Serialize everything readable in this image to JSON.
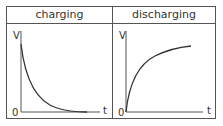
{
  "panels": [
    {
      "title": "charging",
      "y_axis_label": "V",
      "x_axis_label": "t",
      "origin_label": "0",
      "curve": "exponential-decay"
    },
    {
      "title": "discharging",
      "y_axis_label": "V",
      "x_axis_label": "t",
      "origin_label": "0",
      "curve": "exponential-rise"
    }
  ],
  "colors": {
    "line": "#555555",
    "curve": "#333333"
  }
}
